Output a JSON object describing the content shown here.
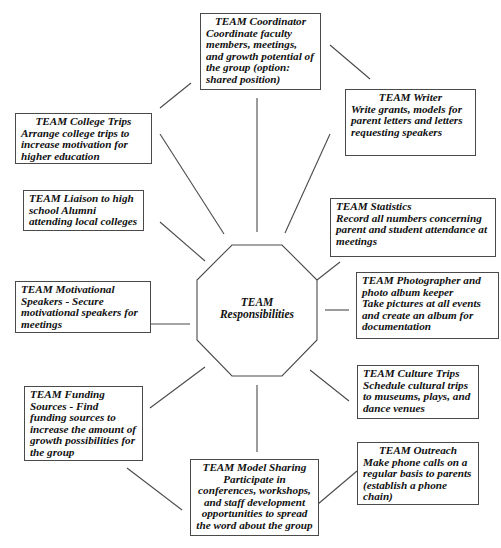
{
  "diagram": {
    "center": {
      "line1": "TEAM",
      "line2": "Responsibilities",
      "shape": "octagon"
    },
    "nodes": [
      {
        "id": "coordinator",
        "title": "TEAM Coordinator",
        "desc": "Coordinate faculty members, meetings, and growth potential of the group (option: shared position)"
      },
      {
        "id": "writer",
        "title": "TEAM Writer",
        "desc": "Write grants, models for parent letters and letters requesting speakers"
      },
      {
        "id": "college-trips",
        "title": "TEAM College Trips",
        "desc": "Arrange college trips to increase motivation for higher education"
      },
      {
        "id": "liaison",
        "title": "TEAM Liaison to high school Alumni attending local colleges",
        "desc": ""
      },
      {
        "id": "statistics",
        "title": "TEAM Statistics",
        "desc": "Record all numbers concerning parent and student attendance at meetings"
      },
      {
        "id": "photographer",
        "title": "TEAM Photographer and photo album keeper",
        "desc": "Take pictures at all events and create an album for documentation"
      },
      {
        "id": "motivational",
        "title": "TEAM Motivational Speakers - Secure motivational speakers for meetings",
        "desc": ""
      },
      {
        "id": "culture-trips",
        "title": "TEAM Culture Trips",
        "desc": "Schedule cultural trips to museums, plays, and dance venues"
      },
      {
        "id": "funding",
        "title": "TEAM Funding Sources - Find funding sources to increase the amount of growth possibilities for the group",
        "desc": ""
      },
      {
        "id": "outreach",
        "title": "TEAM Outreach",
        "desc": "Make phone calls on a regular basis to parents (establish a phone chain)"
      },
      {
        "id": "model-sharing",
        "title": "TEAM Model Sharing",
        "desc": "Participate in conferences, workshops, and staff development opportunities to spread the word about the group"
      }
    ],
    "colors": {
      "line": "#4a4a4a",
      "text": "#111111",
      "background": "#ffffff"
    }
  }
}
